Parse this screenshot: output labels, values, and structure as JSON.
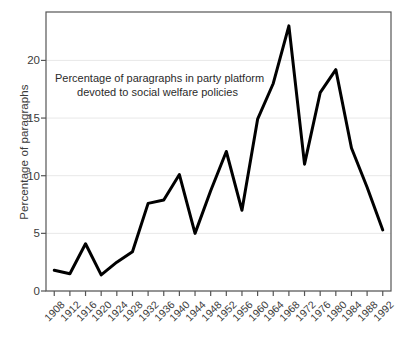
{
  "chart_data": {
    "type": "line",
    "title": "",
    "annotation": [
      "Percentage of paragraphs in party platform",
      "devoted to social welfare policies"
    ],
    "xlabel": "",
    "ylabel": "Percentage of paragraphs",
    "x": [
      1908,
      1912,
      1916,
      1920,
      1924,
      1928,
      1932,
      1936,
      1940,
      1944,
      1948,
      1952,
      1956,
      1960,
      1964,
      1968,
      1972,
      1976,
      1980,
      1984,
      1988,
      1992
    ],
    "categories": [
      "1908",
      "1912",
      "1916",
      "1920",
      "1924",
      "1928",
      "1932",
      "1936",
      "1940",
      "1944",
      "1948",
      "1952",
      "1956",
      "1960",
      "1964",
      "1968",
      "1972",
      "1976",
      "1980",
      "1984",
      "1988",
      "1992"
    ],
    "values": [
      1.8,
      1.5,
      4.1,
      1.4,
      2.5,
      3.4,
      7.6,
      7.9,
      10.1,
      5.0,
      8.7,
      12.1,
      7.0,
      14.9,
      18.0,
      23.0,
      11.0,
      17.2,
      19.2,
      12.4,
      9.0,
      5.3
    ],
    "series": [
      {
        "name": "Percentage of paragraphs devoted to social welfare policies",
        "values": [
          1.8,
          1.5,
          4.1,
          1.4,
          2.5,
          3.4,
          7.6,
          7.9,
          10.1,
          5.0,
          8.7,
          12.1,
          7.0,
          14.9,
          18.0,
          23.0,
          11.0,
          17.2,
          19.2,
          12.4,
          9.0,
          5.3
        ],
        "color": "#000000"
      }
    ],
    "ylim": [
      0,
      24.2
    ],
    "yticks": [
      0,
      5,
      10,
      15,
      20
    ],
    "ytick_labels": [
      "0",
      "5",
      "10",
      "15",
      "20"
    ],
    "xlim": [
      1906,
      1994
    ],
    "xtick_rotation": 45,
    "grid": "horizontal",
    "grid_color": "#e8e8e8",
    "legend": "none",
    "line_width": 3,
    "frame_color": "#555555",
    "background": "#ffffff"
  }
}
